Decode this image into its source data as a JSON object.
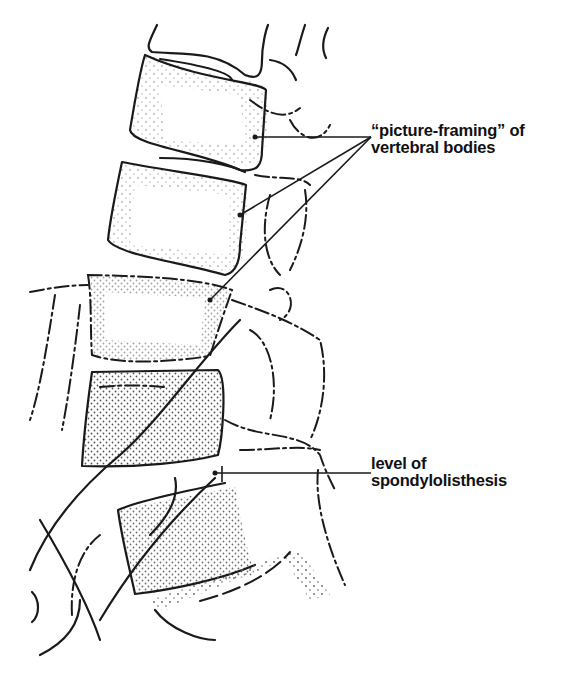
{
  "figure": {
    "annotations": [
      {
        "id": "picture-framing",
        "line1": "“picture-framing” of",
        "line2": "vertebral bodies"
      },
      {
        "id": "spondylolisthesis",
        "line1": "level of",
        "line2": "spondylolisthesis"
      }
    ]
  },
  "colors": {
    "ink": "#1a1a1a",
    "background": "#ffffff",
    "stipple": "#555555"
  }
}
